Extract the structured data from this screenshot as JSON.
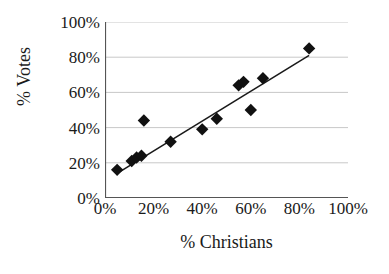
{
  "chart_data": {
    "type": "scatter",
    "title": "",
    "xlabel": "% Christians",
    "ylabel": "% Votes",
    "xlim": [
      0,
      100
    ],
    "ylim": [
      0,
      100
    ],
    "xticks": [
      "0%",
      "20%",
      "40%",
      "60%",
      "80%",
      "100%"
    ],
    "yticks": [
      "0%",
      "20%",
      "40%",
      "60%",
      "80%",
      "100%"
    ],
    "xtick_values": [
      0,
      20,
      40,
      60,
      80,
      100
    ],
    "ytick_values": [
      0,
      20,
      40,
      60,
      80,
      100
    ],
    "grid": "horizontal",
    "legend": "none",
    "marker": "filled-diamond",
    "marker_color": "#111111",
    "series": [
      {
        "name": "Districts",
        "points": [
          {
            "x": 5,
            "y": 16
          },
          {
            "x": 11,
            "y": 21
          },
          {
            "x": 13,
            "y": 23
          },
          {
            "x": 15,
            "y": 24
          },
          {
            "x": 16,
            "y": 44
          },
          {
            "x": 27,
            "y": 32
          },
          {
            "x": 40,
            "y": 39
          },
          {
            "x": 46,
            "y": 45
          },
          {
            "x": 55,
            "y": 64
          },
          {
            "x": 57,
            "y": 66
          },
          {
            "x": 60,
            "y": 50
          },
          {
            "x": 65,
            "y": 68
          },
          {
            "x": 84,
            "y": 85
          }
        ]
      }
    ],
    "trendline": {
      "type": "linear",
      "x_start": 5,
      "y_start": 14,
      "x_end": 84,
      "y_end": 81,
      "color": "#1a1a1a"
    }
  },
  "axes": {
    "y_title": "% Votes",
    "x_title": "% Christians"
  },
  "colors": {
    "background": "#ffffff",
    "grid": "#c8c8c8",
    "axis": "#555555",
    "marker": "#111111",
    "trendline": "#1a1a1a",
    "text": "#1a1a1a"
  }
}
